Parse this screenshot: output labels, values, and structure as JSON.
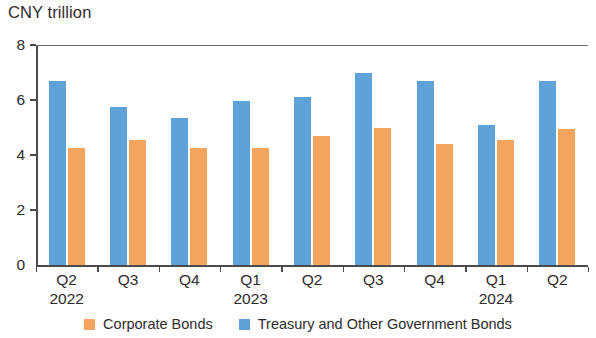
{
  "axis_unit_title": "CNY trillion",
  "y_axis": {
    "ticks": [
      "0",
      "2",
      "4",
      "6",
      "8"
    ],
    "min": 0,
    "max": 8
  },
  "legend": {
    "items": [
      {
        "label": "Corporate Bonds",
        "color": "#f5a55d",
        "key": "corporate"
      },
      {
        "label": "Treasury and Other Government Bonds",
        "color": "#5fa2d9",
        "key": "treasury"
      }
    ]
  },
  "x_axis": {
    "labels": [
      {
        "quarter": "Q2",
        "year": "2022"
      },
      {
        "quarter": "Q3",
        "year": ""
      },
      {
        "quarter": "Q4",
        "year": ""
      },
      {
        "quarter": "Q1",
        "year": "2023"
      },
      {
        "quarter": "Q2",
        "year": ""
      },
      {
        "quarter": "Q3",
        "year": ""
      },
      {
        "quarter": "Q4",
        "year": ""
      },
      {
        "quarter": "Q1",
        "year": "2024"
      },
      {
        "quarter": "Q2",
        "year": ""
      }
    ]
  },
  "chart_data": {
    "type": "bar",
    "title": "",
    "xlabel": "",
    "ylabel": "CNY trillion",
    "ylim": [
      0,
      8
    ],
    "yticks": [
      0,
      2,
      4,
      6,
      8
    ],
    "grid": false,
    "legend_position": "bottom",
    "categories": [
      "Q2 2022",
      "Q3 2022",
      "Q4 2022",
      "Q1 2023",
      "Q2 2023",
      "Q3 2023",
      "Q4 2023",
      "Q1 2024",
      "Q2 2024"
    ],
    "series": [
      {
        "name": "Treasury and Other Government Bonds",
        "color": "#5fa2d9",
        "values": [
          6.7,
          5.75,
          5.35,
          5.95,
          6.1,
          7.0,
          6.7,
          5.1,
          6.7
        ]
      },
      {
        "name": "Corporate Bonds",
        "color": "#f5a55d",
        "values": [
          4.25,
          4.55,
          4.25,
          4.25,
          4.7,
          5.0,
          4.4,
          4.55,
          4.95
        ]
      }
    ]
  }
}
